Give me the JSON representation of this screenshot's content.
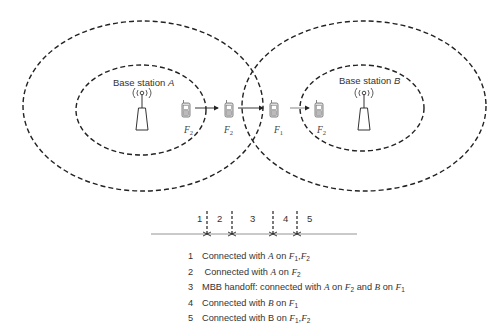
{
  "diagram": {
    "base_stations": [
      {
        "id": "A",
        "label_prefix": "Base station ",
        "label_letter": "A"
      },
      {
        "id": "B",
        "label_prefix": "Base station ",
        "label_letter": "B"
      }
    ],
    "terminals": [
      {
        "position": 1,
        "frequency_letter": "F",
        "frequency_sub": "2"
      },
      {
        "position": 2,
        "frequency_letter": "F",
        "frequency_sub": "2"
      },
      {
        "position": 3,
        "frequency_letter": "F",
        "frequency_sub": "1"
      },
      {
        "position": 4,
        "frequency_letter": "F",
        "frequency_sub": "2"
      }
    ],
    "timeline": {
      "segments": [
        "1",
        "2",
        "3",
        "4",
        "5"
      ]
    },
    "legend": [
      {
        "num": "1",
        "parts": [
          {
            "t": "Connected with "
          },
          {
            "t": "A",
            "i": true
          },
          {
            "t": " on "
          },
          {
            "t": "F",
            "i": true
          },
          {
            "t": "1",
            "sub": true
          },
          {
            "t": ","
          },
          {
            "t": "F",
            "i": true
          },
          {
            "t": "2",
            "sub": true
          }
        ]
      },
      {
        "num": "2",
        "parts": [
          {
            "t": " Connected with "
          },
          {
            "t": "A",
            "i": true
          },
          {
            "t": " on "
          },
          {
            "t": "F",
            "i": true
          },
          {
            "t": "2",
            "sub": true
          }
        ]
      },
      {
        "num": "3",
        "parts": [
          {
            "t": "MBB handoff: connected with "
          },
          {
            "t": "A",
            "i": true
          },
          {
            "t": " on "
          },
          {
            "t": "F",
            "i": true
          },
          {
            "t": "2",
            "sub": true
          },
          {
            "t": " and "
          },
          {
            "t": "B",
            "i": true
          },
          {
            "t": " on "
          },
          {
            "t": "F",
            "i": true
          },
          {
            "t": "1",
            "sub": true
          }
        ]
      },
      {
        "num": "4",
        "parts": [
          {
            "t": "Connected with "
          },
          {
            "t": "B",
            "i": true
          },
          {
            "t": " on "
          },
          {
            "t": "F",
            "i": true
          },
          {
            "t": "1",
            "sub": true
          }
        ]
      },
      {
        "num": "5",
        "parts": [
          {
            "t": "Connected with B on "
          },
          {
            "t": "F",
            "i": true
          },
          {
            "t": "1",
            "sub": true
          },
          {
            "t": ","
          },
          {
            "t": "F",
            "i": true
          },
          {
            "t": "2",
            "sub": true
          }
        ]
      }
    ],
    "colors": {
      "line": "#222222",
      "icon": "#555555",
      "timeline": "#888888"
    }
  }
}
